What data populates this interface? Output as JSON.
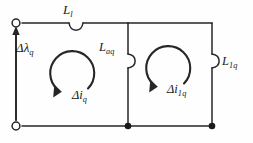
{
  "figure": {
    "kind": "electrical-circuit-diagram",
    "background_color": "#fefefe",
    "line_color": "#262626",
    "text_color": "#1a1a1a"
  },
  "labels": {
    "leakage_inductor": {
      "symbol": "L",
      "subscript": "l",
      "full": "Ll"
    },
    "flux_linkage_source": {
      "symbol": "Δλ",
      "subscript": "q",
      "full": "Δλq"
    },
    "magnetizing_inductor": {
      "symbol": "L",
      "subscript": "aq",
      "full": "Laq"
    },
    "damper_inductor": {
      "symbol": "L",
      "subscript": "1q",
      "full": "L1q"
    },
    "mesh_current_left": {
      "symbol": "Δi",
      "subscript": "q",
      "full": "Δiq"
    },
    "mesh_current_right": {
      "symbol": "Δi",
      "subscript": "1q",
      "full": "Δi1q"
    }
  },
  "nodes": {
    "terminal_top_left": {
      "type": "open-terminal",
      "x": 16,
      "y": 23
    },
    "terminal_bottom_left": {
      "type": "open-terminal",
      "x": 16,
      "y": 126
    },
    "junction_bottom_middle": {
      "type": "filled-node",
      "x": 128,
      "y": 126
    },
    "junction_bottom_right": {
      "type": "filled-node",
      "x": 212,
      "y": 126
    }
  },
  "components": {
    "series_inductor": {
      "name": "Ll",
      "orientation": "horizontal",
      "x": 76,
      "y": 23
    },
    "shunt_inductor_middle": {
      "name": "Laq",
      "orientation": "vertical",
      "x": 128,
      "y": 60
    },
    "shunt_inductor_right": {
      "name": "L1q",
      "orientation": "vertical",
      "x": 212,
      "y": 60
    }
  },
  "arrows": {
    "source_arrow": {
      "name": "flux-linkage-arrow",
      "direction": "up",
      "x": 16,
      "y_from": 120,
      "y_to": 29
    },
    "mesh_loop_left": {
      "name": "left-mesh-arrow",
      "direction": "counterclockwise",
      "cx": 72,
      "cy": 75,
      "r": 22
    },
    "mesh_loop_right": {
      "name": "right-mesh-arrow",
      "direction": "counterclockwise",
      "cx": 168,
      "cy": 70,
      "r": 22
    }
  }
}
